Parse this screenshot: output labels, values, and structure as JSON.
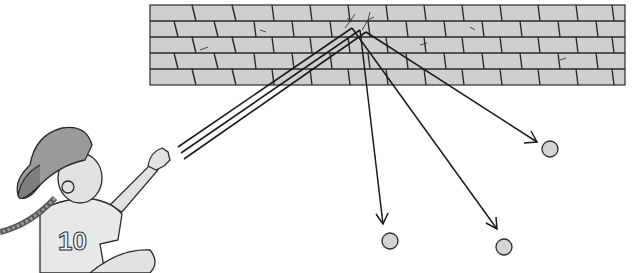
{
  "scene": {
    "description": "Illustration of a girl throwing balls at a brick wall; balls rebound along arrowed paths",
    "colors": {
      "background": "#ffffff",
      "wall": "#cfcfcf",
      "mortar": "#2a2a2a",
      "line": "#1a1a1a",
      "ball": "#d4d4d4",
      "cap": "#9a9a9a",
      "skin": "#e2e2e2",
      "shirt": "#e8e8e8"
    }
  },
  "character": {
    "jersey_number": "10"
  },
  "wall": {
    "x": 150,
    "y": 5,
    "width": 475,
    "height": 80
  },
  "incoming_paths": [
    {
      "from": [
        178,
        147
      ],
      "to": [
        352,
        28
      ]
    },
    {
      "from": [
        181,
        153
      ],
      "to": [
        360,
        30
      ]
    },
    {
      "from": [
        184,
        159
      ],
      "to": [
        366,
        32
      ]
    }
  ],
  "rebound_paths": [
    {
      "from": [
        360,
        30
      ],
      "to": [
        383,
        224
      ],
      "ball": [
        388,
        241
      ]
    },
    {
      "from": [
        352,
        28
      ],
      "to": [
        497,
        229
      ],
      "ball": [
        503,
        246
      ]
    },
    {
      "from": [
        366,
        32
      ],
      "to": [
        537,
        142
      ],
      "ball": [
        550,
        149
      ]
    }
  ]
}
